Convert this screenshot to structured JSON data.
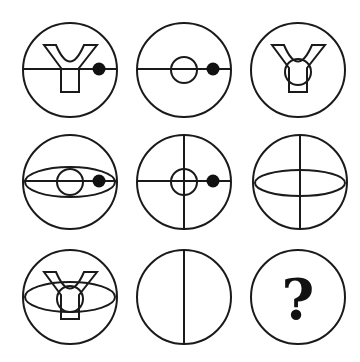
{
  "puzzle": {
    "title": "3x3 figure reasoning matrix",
    "grid": {
      "rows": 3,
      "cols": 3
    },
    "colors": {
      "stroke": "#1a1a1a",
      "fill": "#111111",
      "background": "#ffffff"
    },
    "cells": [
      {
        "row": 1,
        "col": 1,
        "cx": 70,
        "cy": 70,
        "r": 47,
        "elements": [
          "y-shape",
          "horizontal-line",
          "dot"
        ]
      },
      {
        "row": 1,
        "col": 2,
        "cx": 184,
        "cy": 70,
        "r": 47,
        "elements": [
          "horizontal-line",
          "small-circle",
          "dot"
        ]
      },
      {
        "row": 1,
        "col": 3,
        "cx": 298,
        "cy": 70,
        "r": 47,
        "elements": [
          "y-shape",
          "small-circle"
        ]
      },
      {
        "row": 2,
        "col": 1,
        "cx": 70,
        "cy": 182,
        "r": 47,
        "elements": [
          "ellipse",
          "horizontal-line",
          "small-circle",
          "dot"
        ]
      },
      {
        "row": 2,
        "col": 2,
        "cx": 184,
        "cy": 182,
        "r": 47,
        "elements": [
          "horizontal-line",
          "vertical-line",
          "small-circle",
          "dot"
        ]
      },
      {
        "row": 2,
        "col": 3,
        "cx": 300,
        "cy": 182,
        "r": 47,
        "elements": [
          "ellipse",
          "vertical-line"
        ]
      },
      {
        "row": 3,
        "col": 1,
        "cx": 70,
        "cy": 297,
        "r": 47,
        "elements": [
          "y-shape",
          "ellipse",
          "small-circle"
        ]
      },
      {
        "row": 3,
        "col": 2,
        "cx": 184,
        "cy": 297,
        "r": 47,
        "elements": [
          "vertical-line"
        ]
      },
      {
        "row": 3,
        "col": 3,
        "cx": 298,
        "cy": 297,
        "r": 47,
        "elements": [
          "question-mark"
        ]
      }
    ],
    "question_mark": "?"
  }
}
